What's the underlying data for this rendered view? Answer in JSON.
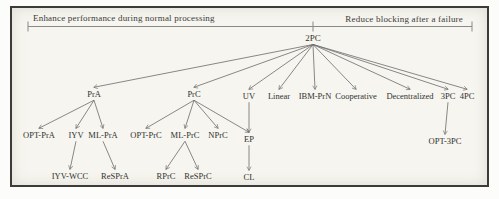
{
  "header": {
    "left_label": "Enhance performance during normal processing",
    "right_label": "Reduce blocking after a failure"
  },
  "colors": {
    "edge": "#6b6b6b",
    "bracket": "#8a8a86",
    "text": "#333230",
    "frame_border": "#3c3b37",
    "paper": "#f6f5ef"
  },
  "nodes": {
    "root": {
      "label": "2PC"
    },
    "pra": {
      "label": "PrA"
    },
    "prc": {
      "label": "PrC"
    },
    "uv": {
      "label": "UV"
    },
    "linear": {
      "label": "Linear"
    },
    "ibm_prn": {
      "label": "IBM-PrN"
    },
    "cooperative": {
      "label": "Cooperative"
    },
    "decentralized": {
      "label": "Decentralized"
    },
    "threepc": {
      "label": "3PC"
    },
    "fourpc": {
      "label": "4PC"
    },
    "opt_pra": {
      "label": "OPT-PrA"
    },
    "iyv": {
      "label": "IYV"
    },
    "ml_pra": {
      "label": "ML-PrA"
    },
    "opt_prc": {
      "label": "OPT-PrC"
    },
    "ml_prc": {
      "label": "ML-PrC"
    },
    "nprc": {
      "label": "NPrC"
    },
    "ep": {
      "label": "EP"
    },
    "iyv_wcc": {
      "label": "IYV-WCC"
    },
    "respra": {
      "label": "ReSPrA"
    },
    "rprc": {
      "label": "RPrC"
    },
    "resprc": {
      "label": "ReSPrC"
    },
    "cl": {
      "label": "CL"
    },
    "opt_3pc": {
      "label": "OPT-3PC"
    }
  },
  "edges": [
    {
      "from": "root",
      "to": "pra"
    },
    {
      "from": "root",
      "to": "prc"
    },
    {
      "from": "root",
      "to": "uv"
    },
    {
      "from": "root",
      "to": "linear"
    },
    {
      "from": "root",
      "to": "ibm_prn"
    },
    {
      "from": "root",
      "to": "cooperative"
    },
    {
      "from": "root",
      "to": "decentralized"
    },
    {
      "from": "root",
      "to": "threepc"
    },
    {
      "from": "root",
      "to": "fourpc"
    },
    {
      "from": "pra",
      "to": "opt_pra"
    },
    {
      "from": "pra",
      "to": "iyv"
    },
    {
      "from": "pra",
      "to": "ml_pra"
    },
    {
      "from": "prc",
      "to": "opt_prc"
    },
    {
      "from": "prc",
      "to": "ml_prc"
    },
    {
      "from": "prc",
      "to": "nprc"
    },
    {
      "from": "prc",
      "to": "ep"
    },
    {
      "from": "uv",
      "to": "ep"
    },
    {
      "from": "iyv",
      "to": "iyv_wcc"
    },
    {
      "from": "ml_pra",
      "to": "respra"
    },
    {
      "from": "ml_prc",
      "to": "rprc"
    },
    {
      "from": "ml_prc",
      "to": "resprc"
    },
    {
      "from": "ep",
      "to": "cl"
    },
    {
      "from": "threepc",
      "to": "opt_3pc"
    }
  ]
}
